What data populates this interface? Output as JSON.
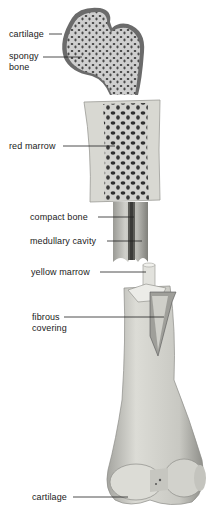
{
  "diagram": {
    "labels": [
      {
        "id": "cartilage-top",
        "text": "cartilage"
      },
      {
        "id": "spongy-bone",
        "text": "spongy\nbone",
        "line1": "spongy",
        "line2": "bone"
      },
      {
        "id": "red-marrow",
        "text": "red marrow"
      },
      {
        "id": "compact-bone",
        "text": "compact bone"
      },
      {
        "id": "medullary-cavity",
        "text": "medullary cavity"
      },
      {
        "id": "yellow-marrow",
        "text": "yellow marrow"
      },
      {
        "id": "fibrous-covering",
        "text": "fibrous\ncovering",
        "line1": "fibrous",
        "line2": "covering"
      },
      {
        "id": "cartilage-bottom",
        "text": "cartilage"
      }
    ],
    "colors": {
      "background": "#ffffff",
      "cartilage": "#6b6b6b",
      "spongy_fill": "#c9c9c9",
      "pore": "#3a3a3a",
      "bone_light": "#d8d8d2",
      "bone_mid": "#b5b5ae",
      "bone_dark": "#7d7d78",
      "leader_line": "#222222"
    }
  }
}
